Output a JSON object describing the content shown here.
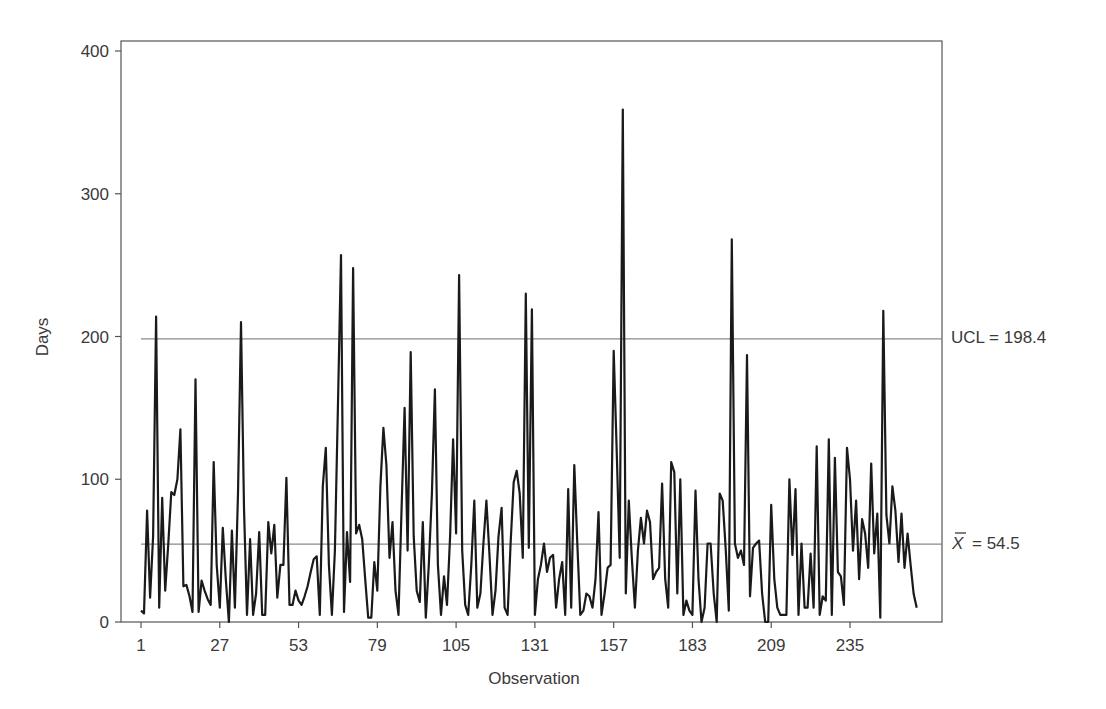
{
  "chart_data": {
    "type": "line",
    "title": "",
    "xlabel": "Observation",
    "ylabel": "Days",
    "ylim": [
      0,
      400
    ],
    "xlim": [
      1,
      260
    ],
    "grid": false,
    "legend": null,
    "y_ticks": [
      0,
      100,
      200,
      300,
      400
    ],
    "x_ticks": [
      1,
      27,
      53,
      79,
      105,
      131,
      157,
      183,
      209,
      235
    ],
    "reference_lines": [
      {
        "name": "UCL",
        "label": "UCL = 198.4",
        "value": 198.4
      },
      {
        "name": "mean",
        "label_symbol": "X̄",
        "label": "= 54.5",
        "value": 54.5
      }
    ],
    "series": [
      {
        "name": "Days",
        "x_start": 1,
        "values": [
          8,
          6,
          78,
          17,
          60,
          214,
          10,
          87,
          22,
          55,
          91,
          89,
          100,
          135,
          25,
          26,
          18,
          7,
          170,
          7,
          29,
          22,
          16,
          12,
          112,
          40,
          10,
          66,
          30,
          0,
          64,
          10,
          90,
          210,
          80,
          5,
          58,
          5,
          20,
          63,
          5,
          5,
          70,
          48,
          68,
          17,
          40,
          40,
          101,
          12,
          12,
          22,
          15,
          12,
          18,
          25,
          35,
          44,
          46,
          5,
          95,
          122,
          40,
          5,
          50,
          150,
          257,
          7,
          63,
          28,
          248,
          62,
          68,
          58,
          30,
          3,
          3,
          42,
          22,
          95,
          136,
          110,
          45,
          70,
          22,
          5,
          80,
          150,
          50,
          189,
          60,
          22,
          14,
          70,
          3,
          40,
          90,
          163,
          40,
          5,
          32,
          12,
          60,
          128,
          62,
          243,
          50,
          12,
          5,
          40,
          85,
          10,
          20,
          55,
          85,
          48,
          5,
          22,
          60,
          80,
          10,
          5,
          55,
          98,
          106,
          90,
          45,
          230,
          52,
          219,
          5,
          30,
          40,
          55,
          35,
          45,
          47,
          10,
          30,
          42,
          5,
          93,
          10,
          110,
          55,
          5,
          8,
          20,
          18,
          10,
          30,
          77,
          5,
          20,
          38,
          40,
          190,
          120,
          45,
          359,
          20,
          85,
          45,
          10,
          50,
          73,
          55,
          78,
          70,
          30,
          35,
          38,
          97,
          30,
          10,
          112,
          105,
          20,
          100,
          5,
          15,
          8,
          5,
          92,
          30,
          0,
          10,
          55,
          55,
          20,
          0,
          90,
          85,
          50,
          8,
          268,
          55,
          45,
          50,
          40,
          187,
          18,
          52,
          55,
          57,
          20,
          0,
          0,
          82,
          30,
          10,
          5,
          5,
          5,
          100,
          47,
          93,
          5,
          55,
          10,
          10,
          48,
          10,
          123,
          5,
          18,
          15,
          128,
          5,
          115,
          35,
          32,
          12,
          122,
          100,
          50,
          85,
          30,
          72,
          62,
          38,
          111,
          48,
          76,
          3,
          218,
          75,
          55,
          95,
          78,
          42,
          76,
          38,
          62,
          40,
          20,
          10
        ]
      }
    ]
  },
  "axes": {
    "y_label": "Days",
    "x_label": "Observation"
  },
  "annotations": {
    "ucl_label": "UCL = 198.4",
    "mean_symbol": "X",
    "mean_label": "= 54.5"
  }
}
